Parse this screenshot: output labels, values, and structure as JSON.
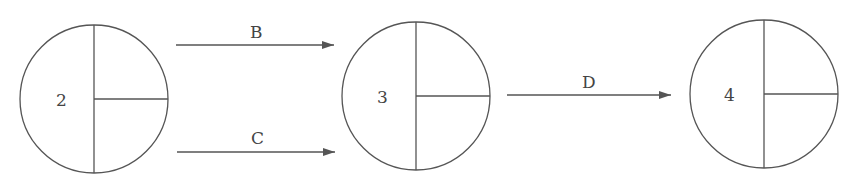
{
  "diagram": {
    "type": "activity-on-arrow network",
    "nodes": [
      {
        "id": "node-2",
        "label": "2",
        "cx": 94,
        "cy": 99,
        "r": 74
      },
      {
        "id": "node-3",
        "label": "3",
        "cx": 416,
        "cy": 96,
        "r": 74
      },
      {
        "id": "node-4",
        "label": "4",
        "cx": 764,
        "cy": 94,
        "r": 74
      }
    ],
    "edges": [
      {
        "label": "B",
        "from": "2",
        "to": "3",
        "x1": 176,
        "x2": 334,
        "y": 45
      },
      {
        "label": "C",
        "from": "2",
        "to": "3",
        "x1": 177,
        "x2": 335,
        "y": 152
      },
      {
        "label": "D",
        "from": "3",
        "to": "4",
        "x1": 507,
        "x2": 671,
        "y": 95
      }
    ],
    "colors": {
      "stroke": "#555555",
      "text": "#444444",
      "background": "#ffffff"
    }
  }
}
